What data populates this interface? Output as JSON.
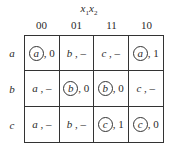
{
  "title": {
    "base1": "x",
    "sub1": "1",
    "base2": "x",
    "sub2": "2"
  },
  "columns": [
    "00",
    "01",
    "11",
    "10"
  ],
  "rows": [
    {
      "label": "a",
      "cells": [
        {
          "state": "a",
          "stable": true,
          "out": ", 0"
        },
        {
          "state": "b",
          "stable": false,
          "out": " , –"
        },
        {
          "state": "c",
          "stable": false,
          "out": " , –"
        },
        {
          "state": "a",
          "stable": true,
          "out": ", 1"
        }
      ]
    },
    {
      "label": "b",
      "cells": [
        {
          "state": "a",
          "stable": false,
          "out": " , –"
        },
        {
          "state": "b",
          "stable": true,
          "out": ", 0"
        },
        {
          "state": "b",
          "stable": true,
          "out": ", 0"
        },
        {
          "state": "c",
          "stable": false,
          "out": " , –"
        }
      ]
    },
    {
      "label": "c",
      "cells": [
        {
          "state": "a",
          "stable": false,
          "out": " , –"
        },
        {
          "state": "b",
          "stable": false,
          "out": " , –"
        },
        {
          "state": "c",
          "stable": true,
          "out": ", 1"
        },
        {
          "state": "c",
          "stable": true,
          "out": ", 0"
        }
      ]
    }
  ]
}
